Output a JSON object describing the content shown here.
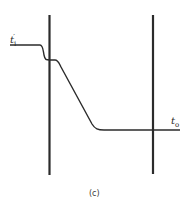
{
  "diagram": {
    "labels": {
      "input_temp": "t",
      "input_sub": "i",
      "input_prime": "′",
      "output_temp": "t",
      "output_sub": "o"
    },
    "caption": "(c)",
    "colors": {
      "line": "#2b2b2b",
      "background": "#ffffff"
    }
  }
}
